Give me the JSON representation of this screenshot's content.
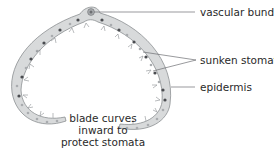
{
  "diagram": {
    "labels": {
      "vascular_bundle": "vascular bundle",
      "sunken_stomata": "sunken stomata",
      "epidermis": "epidermis"
    },
    "caption_lines": [
      "blade curves",
      "inward to",
      "protect stomata"
    ],
    "colors": {
      "tissue_fill": "#d8dadb",
      "tissue_outline": "#8c8f92",
      "cell_dark": "#4a4c50",
      "cell_light": "#a9acaf",
      "leader_line": "#6d6f72",
      "text": "#2a2a2a"
    }
  }
}
